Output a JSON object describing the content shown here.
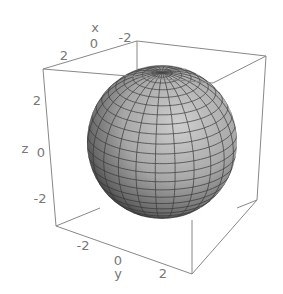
{
  "chart_data": {
    "type": "surface3d",
    "title": "",
    "surface": "sphere",
    "radius": 3,
    "center": [
      0,
      0,
      0
    ],
    "box": {
      "x": [
        -3,
        3
      ],
      "y": [
        -3,
        3
      ],
      "z": [
        -3,
        3
      ]
    },
    "xlabel": "x",
    "ylabel": "y",
    "zlabel": "z",
    "xticks": [
      "2",
      "0",
      "-2"
    ],
    "yticks": [
      "-2",
      "0",
      "2"
    ],
    "zticks": [
      "2",
      "0",
      "-2"
    ],
    "mesh": {
      "latitude_lines": 24,
      "longitude_lines": 24
    },
    "shading": "grayscale"
  },
  "labels": {
    "x_axis": "x",
    "x_ticks": {
      "t0": "2",
      "t1": "0",
      "t2": "-2"
    },
    "y_axis": "y",
    "y_ticks": {
      "t0": "-2",
      "t1": "0",
      "t2": "2"
    },
    "z_axis": "z",
    "z_ticks": {
      "t0": "2",
      "t1": "0",
      "t2": "-2"
    }
  },
  "colors": {
    "box": "#888888",
    "sphere_light": "#c8c8c8",
    "sphere_mid": "#9a9a9a",
    "sphere_dark": "#2a2a2a",
    "mesh": "#333333",
    "label": "#777777"
  }
}
